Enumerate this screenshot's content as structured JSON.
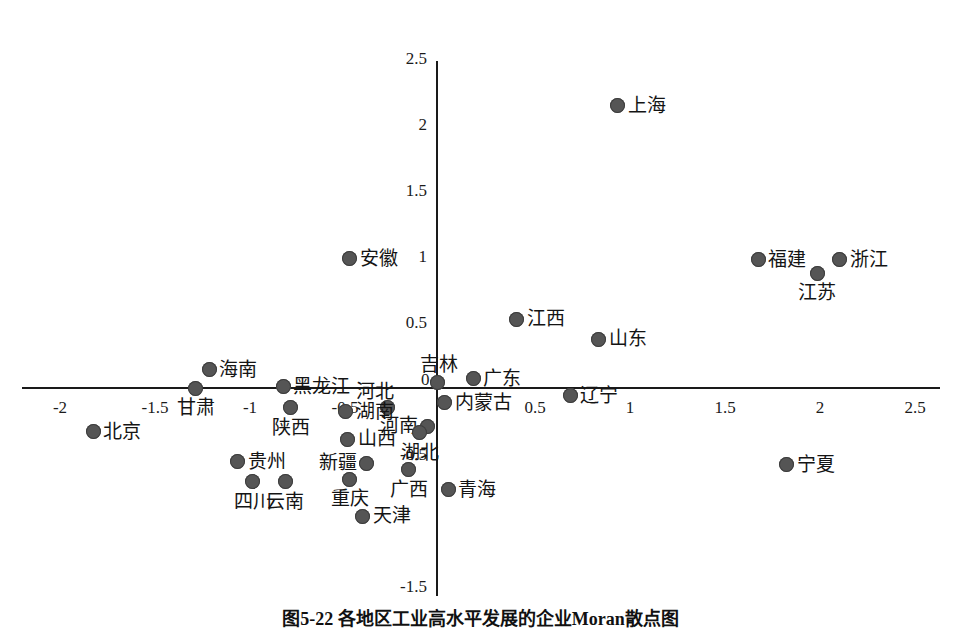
{
  "chart_data": {
    "type": "scatter",
    "title": "图5-22  各地区工业高水平发展的企业Moran散点图",
    "xlabel": "",
    "ylabel": "",
    "xlim": [
      -2.25,
      2.6
    ],
    "ylim": [
      -1.55,
      2.55
    ],
    "grid": false,
    "legend": "none",
    "axes_style": "centered-cross",
    "xticks": [
      -2,
      -1.5,
      -1,
      -0.5,
      0,
      0.5,
      1,
      1.5,
      2,
      2.5
    ],
    "xtick_labels": [
      "-2",
      "-1.5",
      "-1",
      "-0.5",
      "0",
      "0.5",
      "1",
      "1.5",
      "2",
      "2.5"
    ],
    "yticks": [
      -1.5,
      -0.5,
      0,
      0.5,
      1,
      1.5,
      2,
      2.5
    ],
    "ytick_labels": [
      "-1.5",
      "-0.5",
      "0",
      "0.5",
      "1",
      "1.5",
      "2",
      "2.5"
    ],
    "points": [
      {
        "label": "上海",
        "x": 0.95,
        "y": 2.14,
        "label_pos": "right"
      },
      {
        "label": "安徽",
        "x": -0.46,
        "y": 0.98,
        "label_pos": "right"
      },
      {
        "label": "福建",
        "x": 1.69,
        "y": 0.97,
        "label_pos": "right"
      },
      {
        "label": "浙江",
        "x": 2.12,
        "y": 0.97,
        "label_pos": "right"
      },
      {
        "label": "江苏",
        "x": 2.0,
        "y": 0.87,
        "label_pos": "below"
      },
      {
        "label": "江西",
        "x": 0.42,
        "y": 0.52,
        "label_pos": "right"
      },
      {
        "label": "山东",
        "x": 0.85,
        "y": 0.37,
        "label_pos": "right"
      },
      {
        "label": "海南",
        "x": -1.2,
        "y": 0.14,
        "label_pos": "right"
      },
      {
        "label": "甘肃",
        "x": -1.27,
        "y": 0.0,
        "label_pos": "below"
      },
      {
        "label": "黑龙江",
        "x": -0.81,
        "y": 0.01,
        "label_pos": "right"
      },
      {
        "label": "吉林",
        "x": 0.0,
        "y": 0.04,
        "label_pos": "above"
      },
      {
        "label": "广东",
        "x": 0.19,
        "y": 0.07,
        "label_pos": "right"
      },
      {
        "label": "河北",
        "x": -0.26,
        "y": -0.15,
        "label_pos": "above-left"
      },
      {
        "label": "内蒙古",
        "x": 0.04,
        "y": -0.11,
        "label_pos": "right"
      },
      {
        "label": "湖南",
        "x": -0.48,
        "y": -0.18,
        "label_pos": "right"
      },
      {
        "label": "辽宁",
        "x": 0.7,
        "y": -0.06,
        "label_pos": "right"
      },
      {
        "label": "陕西",
        "x": -0.77,
        "y": -0.15,
        "label_pos": "below"
      },
      {
        "label": "河南",
        "x": -0.05,
        "y": -0.29,
        "label_pos": "left"
      },
      {
        "label": "湖北",
        "x": -0.09,
        "y": -0.34,
        "label_pos": "below"
      },
      {
        "label": "山西",
        "x": -0.47,
        "y": -0.39,
        "label_pos": "right"
      },
      {
        "label": "新疆",
        "x": -0.37,
        "y": -0.57,
        "label_pos": "left"
      },
      {
        "label": "贵州",
        "x": -1.05,
        "y": -0.56,
        "label_pos": "right"
      },
      {
        "label": "广西",
        "x": -0.15,
        "y": -0.62,
        "label_pos": "below"
      },
      {
        "label": "宁夏",
        "x": 1.84,
        "y": -0.58,
        "label_pos": "right"
      },
      {
        "label": "四川",
        "x": -0.97,
        "y": -0.71,
        "label_pos": "below"
      },
      {
        "label": "云南",
        "x": -0.8,
        "y": -0.71,
        "label_pos": "below"
      },
      {
        "label": "重庆",
        "x": -0.46,
        "y": -0.69,
        "label_pos": "below"
      },
      {
        "label": "青海",
        "x": 0.06,
        "y": -0.77,
        "label_pos": "right"
      },
      {
        "label": "天津",
        "x": -0.39,
        "y": -0.97,
        "label_pos": "right"
      },
      {
        "label": "北京",
        "x": -1.81,
        "y": -0.33,
        "label_pos": "right"
      }
    ]
  },
  "caption": {
    "text": "图5-22  各地区工业高水平发展的企业Moran散点图"
  },
  "colors": {
    "marker": "#555555",
    "axis": "#1a1a1a",
    "text": "#141414"
  }
}
